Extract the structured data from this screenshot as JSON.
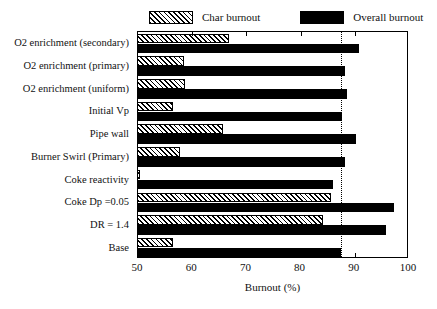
{
  "chart_data": {
    "type": "bar",
    "orientation": "horizontal",
    "title": "",
    "xlabel": "Burnout (%)",
    "ylabel": "",
    "xlim": [
      50,
      100
    ],
    "xticks": [
      50,
      60,
      70,
      80,
      90,
      100
    ],
    "xtick_labels": [
      "50",
      "60",
      "70",
      "80",
      "90",
      "100"
    ],
    "grid": false,
    "legend_position": "top",
    "categories": [
      "O2 enrichment (secondary)",
      "O2 enrichment (primary)",
      "O2 enrichment (uniform)",
      "Initial Vp",
      "Pipe wall",
      "Burner Swirl (Primary)",
      "Coke reactivity",
      "Coke  Dp =0.05",
      "DR = 1.4",
      "Base"
    ],
    "series": [
      {
        "name": "Char burnout",
        "style": "hatched",
        "color": "#000000",
        "values": [
          66.8,
          58.4,
          58.7,
          56.5,
          65.6,
          57.8,
          50.3,
          85.6,
          84.2,
          56.4
        ]
      },
      {
        "name": "Overall burnout",
        "style": "solid",
        "color": "#000000",
        "values": [
          90.8,
          88.2,
          88.6,
          87.6,
          90.2,
          88.2,
          86.0,
          97.2,
          95.8,
          87.5
        ]
      }
    ],
    "annotations": [
      {
        "type": "vertical-reference-line",
        "style": "dotted",
        "value": 87.5,
        "label": "Base overall burnout reference"
      }
    ]
  },
  "legend": {
    "entries": [
      {
        "label": "Char burnout",
        "swatch": "hatched-swatch"
      },
      {
        "label": "Overall burnout",
        "swatch": "solid-swatch"
      }
    ]
  }
}
